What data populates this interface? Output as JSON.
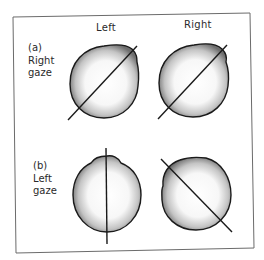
{
  "figure": {
    "column_headers": [
      "Left",
      "Right"
    ],
    "rows": [
      {
        "id": "a",
        "label_lines": [
          "(a)",
          "Right",
          "gaze"
        ]
      },
      {
        "id": "b",
        "label_lines": [
          "(b)",
          "Left",
          "gaze"
        ]
      }
    ],
    "colors": {
      "frame": "#6b6b6b",
      "outline": "#1a1a1a",
      "shade_dark": "#7a7a7a",
      "shade_light": "#ffffff",
      "text": "#2a2a2a"
    },
    "panels": [
      {
        "row": "a",
        "column": "Left",
        "line": {
          "x1": 68,
          "y1": 120,
          "x2": 137,
          "y2": 46
        }
      },
      {
        "row": "a",
        "column": "Right",
        "line": {
          "x1": 158,
          "y1": 119,
          "x2": 227,
          "y2": 45
        }
      },
      {
        "row": "b",
        "column": "Left",
        "line": {
          "x1": 106,
          "y1": 148,
          "x2": 107,
          "y2": 244
        }
      },
      {
        "row": "b",
        "column": "Right",
        "line": {
          "x1": 161,
          "y1": 159,
          "x2": 232,
          "y2": 232
        }
      }
    ]
  }
}
